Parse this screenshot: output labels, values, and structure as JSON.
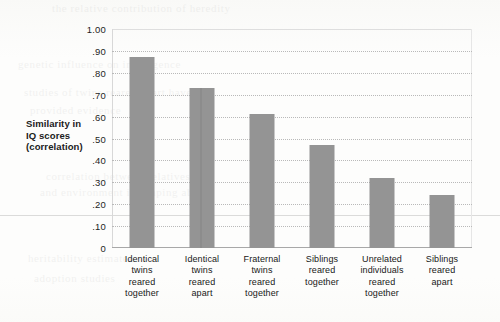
{
  "chart_data": {
    "type": "bar",
    "title": "",
    "subtitle": "",
    "xlabel": "",
    "ylabel": "Similarity in IQ scores (correlation)",
    "ylabel_lines": [
      "Similarity in",
      "IQ scores",
      "(correlation)"
    ],
    "ylim": [
      0,
      1.0
    ],
    "ytick_values": [
      1.0,
      0.9,
      0.8,
      0.7,
      0.6,
      0.5,
      0.4,
      0.3,
      0.2,
      0.1,
      0
    ],
    "ytick_labels": [
      "1.00",
      ".90",
      ".80",
      ".70",
      ".60",
      ".50",
      ".40",
      ".30",
      ".20",
      ".10",
      "0"
    ],
    "grid": "horizontal-dotted",
    "legend": "none",
    "bar_color": "#949494",
    "categories": [
      "Identical twins reared together",
      "Identical twins reared apart",
      "Fraternal twins reared together",
      "Siblings reared together",
      "Unrelated individuals reared together",
      "Siblings reared apart"
    ],
    "category_lines": [
      [
        "Identical",
        "twins",
        "reared",
        "together"
      ],
      [
        "Identical",
        "twins",
        "reared",
        "apart"
      ],
      [
        "Fraternal",
        "twins",
        "reared",
        "together"
      ],
      [
        "Siblings",
        "reared",
        "together"
      ],
      [
        "Unrelated",
        "individuals",
        "reared",
        "together"
      ],
      [
        "Siblings",
        "reared",
        "apart"
      ]
    ],
    "values": [
      0.87,
      0.73,
      0.61,
      0.47,
      0.32,
      0.24
    ]
  },
  "artifacts": {
    "bleed_lines": [
      {
        "top": 2,
        "left": 52,
        "text": "the relative contribution of heredity"
      },
      {
        "top": 58,
        "left": 18,
        "text": "genetic influence on intelligence"
      },
      {
        "top": 86,
        "left": 24,
        "text": "studies of twins reared apart have"
      },
      {
        "top": 104,
        "left": 30,
        "text": "provided evidence"
      },
      {
        "top": 170,
        "left": 46,
        "text": "correlation between relatives"
      },
      {
        "top": 186,
        "left": 40,
        "text": "and environment in shaping ability"
      },
      {
        "top": 252,
        "left": 28,
        "text": "heritability estimates"
      },
      {
        "top": 272,
        "left": 34,
        "text": "adoption studies"
      }
    ],
    "rule_top": 215
  }
}
